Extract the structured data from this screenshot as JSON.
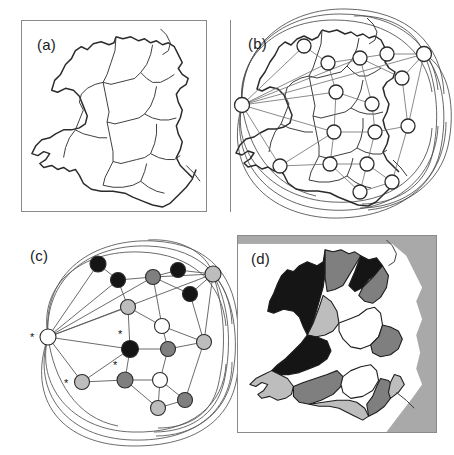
{
  "figure": {
    "background": "#ffffff"
  },
  "panels": [
    {
      "id": "a",
      "label": "(a)",
      "caption": "Outline map of Wales divided into administrative regions",
      "content": "region-outline-map"
    },
    {
      "id": "b",
      "label": "(b)",
      "caption": "Region adjacency graph overlaid on the map, nodes at region centroids",
      "content": "graph-overlay-map"
    },
    {
      "id": "c",
      "label": "(c)",
      "caption": "Abstract adjacency graph with four-colouring; asterisks mark selected nodes",
      "content": "abstract-coloured-graph"
    },
    {
      "id": "d",
      "label": "(d)",
      "caption": "Choropleth map shaded with the four-colour solution",
      "content": "coloured-choropleth-map"
    }
  ],
  "colors": {
    "black": "#151515",
    "dark_gray": "#7f7f7f",
    "light_gray": "#bdbdbd",
    "white": "#ffffff",
    "sea": "#a9a9a9",
    "outline": "#2b2b2b",
    "edge": "#5a5a5a",
    "panel_border": "#8a8a8a"
  },
  "legend": {
    "classes": [
      "black",
      "dark-gray",
      "light-gray",
      "white"
    ],
    "class_count": 4
  },
  "graph": {
    "node_count_panel_b": 17,
    "node_count_panel_c": 17,
    "marked_node_count": 4,
    "marker_glyph": "*",
    "nodes": [
      {
        "id": "n1",
        "fill": "white",
        "marked": true,
        "bx": 30,
        "by": 99,
        "cx": 40,
        "cy": 105
      },
      {
        "id": "n2",
        "fill": "black",
        "marked": false,
        "bx": 92,
        "by": 40,
        "cx": 90,
        "cy": 32
      },
      {
        "id": "n3",
        "fill": "black",
        "marked": false,
        "bx": 116,
        "by": 57,
        "cx": 110,
        "cy": 48
      },
      {
        "id": "n4",
        "fill": "dark_gray",
        "marked": false,
        "bx": 148,
        "by": 52,
        "cx": 145,
        "cy": 45
      },
      {
        "id": "n5",
        "fill": "black",
        "marked": false,
        "bx": 175,
        "by": 48,
        "cx": 170,
        "cy": 38
      },
      {
        "id": "n6",
        "fill": "light_gray",
        "marked": false,
        "bx": 212,
        "by": 48,
        "cx": 205,
        "cy": 42
      },
      {
        "id": "n7",
        "fill": "black",
        "marked": false,
        "bx": 190,
        "by": 72,
        "cx": 182,
        "cy": 62
      },
      {
        "id": "n8",
        "fill": "light_gray",
        "marked": false,
        "bx": 124,
        "by": 86,
        "cx": 120,
        "cy": 75
      },
      {
        "id": "n9",
        "fill": "white",
        "marked": false,
        "bx": 160,
        "by": 98,
        "cx": 154,
        "cy": 94
      },
      {
        "id": "n10",
        "fill": "black",
        "marked": true,
        "bx": 122,
        "by": 126,
        "cx": 122,
        "cy": 117
      },
      {
        "id": "n11",
        "fill": "dark_gray",
        "marked": false,
        "bx": 163,
        "by": 126,
        "cx": 160,
        "cy": 117
      },
      {
        "id": "n12",
        "fill": "light_gray",
        "marked": true,
        "bx": 68,
        "by": 160,
        "cx": 74,
        "cy": 150
      },
      {
        "id": "n13",
        "fill": "dark_gray",
        "marked": true,
        "bx": 118,
        "by": 158,
        "cx": 117,
        "cy": 148
      },
      {
        "id": "n14",
        "fill": "white",
        "marked": false,
        "bx": 155,
        "by": 158,
        "cx": 152,
        "cy": 148
      },
      {
        "id": "n15",
        "fill": "light_gray",
        "marked": false,
        "bx": 148,
        "by": 186,
        "cx": 150,
        "cy": 176
      },
      {
        "id": "n16",
        "fill": "dark_gray",
        "marked": false,
        "bx": 180,
        "by": 176,
        "cx": 177,
        "cy": 168
      },
      {
        "id": "n17",
        "fill": "light_gray",
        "marked": false,
        "bx": 196,
        "by": 120,
        "cx": 196,
        "cy": 110
      }
    ]
  }
}
